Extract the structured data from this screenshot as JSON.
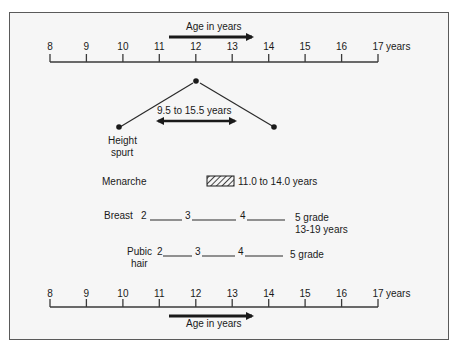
{
  "top_axis": {
    "title": "Age in years",
    "ticks": [
      "8",
      "9",
      "10",
      "11",
      "12",
      "13",
      "14",
      "15",
      "16",
      "17"
    ],
    "unit": "years"
  },
  "bottom_axis": {
    "title": "Age in years",
    "ticks": [
      "8",
      "9",
      "10",
      "11",
      "12",
      "13",
      "14",
      "15",
      "16",
      "17"
    ],
    "unit": "years"
  },
  "height_spurt": {
    "label_line1": "Height",
    "label_line2": "spurt",
    "range": "9.5 to 15.5 years"
  },
  "menarche": {
    "label": "Menarche",
    "range": "11.0 to 14.0 years"
  },
  "breast": {
    "label": "Breast",
    "stages": [
      "2",
      "3",
      "4",
      "5 grade"
    ],
    "range": "13-19 years"
  },
  "pubic_hair": {
    "label_line1": "Pubic",
    "label_line2": "hair",
    "stages": [
      "2",
      "3",
      "4",
      "5 grade"
    ]
  },
  "colors": {
    "line": "#1a1a1a",
    "background": "#f6f6f6",
    "border": "#5a5a5a"
  }
}
